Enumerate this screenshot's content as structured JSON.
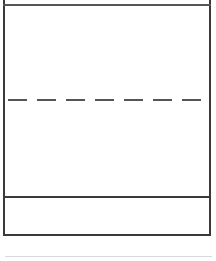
{
  "diagram": {
    "type": "wireframe-box",
    "sections": [
      {
        "name": "top-header-strip",
        "label": ""
      },
      {
        "name": "upper-body",
        "label": ""
      },
      {
        "name": "lower-body",
        "label": ""
      },
      {
        "name": "bottom-section",
        "label": ""
      }
    ],
    "lines": {
      "top": {
        "style": "solid",
        "color": "#555555"
      },
      "middle": {
        "style": "dashed",
        "color": "#555555"
      },
      "divider": {
        "style": "solid",
        "color": "#3a3a3a"
      },
      "footer": {
        "style": "solid",
        "color": "#d8d8d8"
      }
    }
  }
}
